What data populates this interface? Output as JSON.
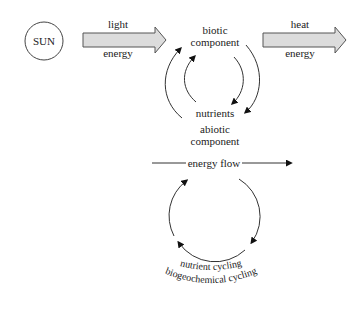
{
  "sun": {
    "label": "SUN"
  },
  "input_arrow": {
    "top": "light",
    "bottom": "energy"
  },
  "output_arrow": {
    "top": "heat",
    "bottom": "energy"
  },
  "cycle": {
    "top_line1": "biotic",
    "top_line2": "component",
    "bottom": "nutrients",
    "abiotic_line1": "abiotic",
    "abiotic_line2": "component"
  },
  "legend": {
    "energy_flow": "energy flow",
    "nutrient_cycling": "nutrient cycling",
    "biogeochemical_cycling": "biogeochemical cycling"
  },
  "colors": {
    "arrow_fill": "#dcdcdc",
    "stroke": "#333333"
  }
}
